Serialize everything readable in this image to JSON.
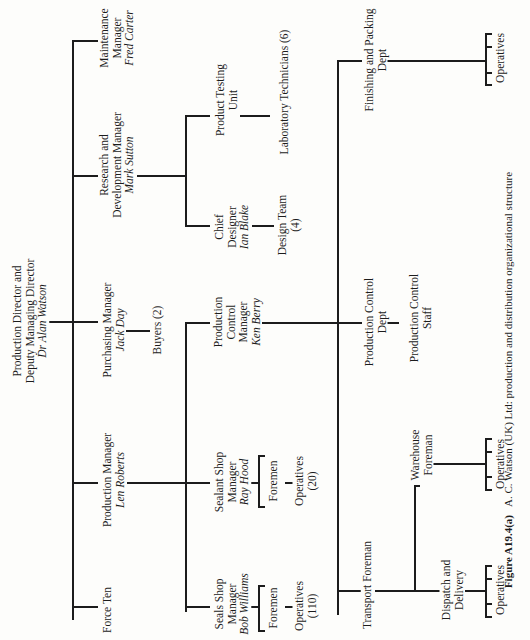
{
  "diagram": {
    "type": "organization-chart",
    "orientation": "rotated-90-ccw",
    "root": {
      "title_lines": [
        "Production Director and",
        "Deputy Managing Director"
      ],
      "name": "Dr Alan Watson"
    },
    "maintenance": {
      "title_lines": [
        "Maintenance",
        "Manager"
      ],
      "name": "Fred Carter"
    },
    "rnd": {
      "title_lines": [
        "Research and",
        "Development Manager"
      ],
      "name": "Mark Sutton"
    },
    "purchasing": {
      "title_lines": [
        "Purchasing Manager"
      ],
      "name": "Jack Day"
    },
    "buyers": {
      "label": "Buyers (2)"
    },
    "production": {
      "title_lines": [
        "Production Manager"
      ],
      "name": "Len Roberts"
    },
    "force_ten": {
      "label": "Force Ten"
    },
    "product_testing": {
      "title_lines": [
        "Product Testing",
        "Unit"
      ]
    },
    "lab_techs": {
      "label": "Laboratory Technicians (6)"
    },
    "chief_designer": {
      "title_lines": [
        "Chief",
        "Designer"
      ],
      "name": "Ian Blake"
    },
    "design_team": {
      "title_lines": [
        "Design Team",
        "(4)"
      ]
    },
    "prod_control_mgr": {
      "title_lines": [
        "Production",
        "Control",
        "Manager"
      ],
      "name": "Ken Berry"
    },
    "sealant_shop": {
      "title_lines": [
        "Sealant Shop",
        "Manager"
      ],
      "name": "Ray Hood"
    },
    "sealant_foremen": {
      "label": "Foremen"
    },
    "sealant_operatives": {
      "title_lines": [
        "Operatives",
        "(20)"
      ]
    },
    "seals_shop": {
      "title_lines": [
        "Seals Shop",
        "Manager"
      ],
      "name": "Bob Williams"
    },
    "seals_foremen": {
      "label": "Foremen"
    },
    "seals_operatives": {
      "title_lines": [
        "Operatives",
        "(110)"
      ]
    },
    "finishing": {
      "title_lines": [
        "Finishing and Packing",
        "Dept"
      ]
    },
    "finishing_operatives": {
      "label": "Operatives"
    },
    "prod_control_dept": {
      "title_lines": [
        "Production Control",
        "Dept"
      ]
    },
    "prod_control_staff": {
      "title_lines": [
        "Production Control",
        "Staff"
      ]
    },
    "transport": {
      "label": "Transport Foreman"
    },
    "warehouse": {
      "title_lines": [
        "Warehouse",
        "Foreman"
      ]
    },
    "warehouse_operatives": {
      "label": "Operatives"
    },
    "dispatch": {
      "title_lines": [
        "Dispatch and",
        "Delivery"
      ]
    },
    "dispatch_operatives": {
      "label": "Operatives"
    }
  },
  "caption": {
    "figure_label": "Figure A19.4(a)",
    "text": "A. C. Watson (UK) Ltd: production and distribution organizational structure"
  }
}
